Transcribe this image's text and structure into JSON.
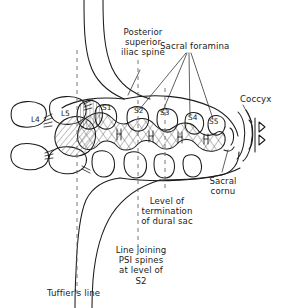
{
  "figure": {
    "type": "anatomical-line-diagram",
    "background_color": "#ffffff",
    "line_color": "#1b1b1b",
    "hatch_color": "#555555"
  },
  "callouts": {
    "psis": "Posterior\nsuperior\niliac spine",
    "sacral_foramina": "Sacral foramina",
    "coccyx": "Coccyx",
    "sacral_cornu": "Sacral\ncornu",
    "dural_sac": "Level of\ntermination\nof dural sac",
    "psi_line": "Line joining\nPSI spines\nat level of\nS2",
    "tuffiers_line": "Tuffier's line"
  },
  "vertebrae": [
    {
      "id": "L4",
      "label": "L4"
    },
    {
      "id": "L5",
      "label": "L5"
    },
    {
      "id": "S1",
      "label": "S1"
    },
    {
      "id": "S2",
      "label": "S2"
    },
    {
      "id": "S3",
      "label": "S3"
    },
    {
      "id": "S4",
      "label": "S4"
    },
    {
      "id": "S5",
      "label": "S5"
    }
  ]
}
